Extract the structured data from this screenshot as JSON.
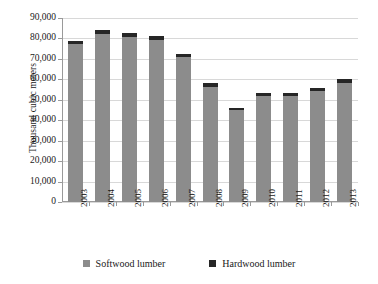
{
  "chart_data": {
    "type": "bar",
    "stacked": true,
    "title": "",
    "subtitle": "",
    "xlabel": "",
    "ylabel": "Thousand cubic meters",
    "ylim": [
      0,
      90000
    ],
    "ytick_step": 10000,
    "ytick_labels": [
      "90,000",
      "80,000",
      "70,000",
      "60,000",
      "50,000",
      "40,000",
      "30,000",
      "20,000",
      "10,000",
      "0"
    ],
    "ytick_values": [
      90000,
      80000,
      70000,
      60000,
      50000,
      40000,
      30000,
      20000,
      10000,
      0
    ],
    "grid": true,
    "grid_axis": "y",
    "legend_position": "bottom",
    "categories": [
      "2003",
      "2004",
      "2005",
      "2006",
      "2007",
      "2008",
      "2009",
      "2010",
      "2011",
      "2012",
      "2013"
    ],
    "series": [
      {
        "name": "Softwood lumber",
        "color": "#8c8c8c",
        "values": [
          77500,
          82000,
          80500,
          79200,
          71000,
          56200,
          44800,
          52000,
          52000,
          54300,
          58200
        ]
      },
      {
        "name": "Hardwood lumber",
        "color": "#262626",
        "values": [
          1500,
          2000,
          2000,
          1800,
          1500,
          1800,
          1200,
          1500,
          1500,
          1700,
          1800
        ]
      }
    ],
    "totals": [
      79000,
      84000,
      82500,
      81000,
      72500,
      58000,
      46000,
      53500,
      53500,
      56000,
      60000
    ]
  },
  "legend": {
    "items": [
      {
        "label": "Softwood lumber",
        "swatch": "softwood-swatch"
      },
      {
        "label": "Hardwood lumber",
        "swatch": "hardwood-swatch"
      }
    ]
  },
  "colors": {
    "softwood": "#8c8c8c",
    "hardwood": "#262626",
    "gridline": "#d8d8d8",
    "axis": "#9a9a9a",
    "background": "#ffffff",
    "text": "#1a1a1a"
  }
}
